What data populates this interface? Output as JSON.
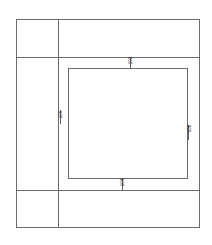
{
  "drawing": {
    "title": "Technical line drawing",
    "background_color": "#ffffff",
    "line_color": "#6b6b6b",
    "label_color": "#2b2b2b",
    "outer_frame": {
      "name": "outer-frame",
      "left": 16,
      "top": 19,
      "right": 199,
      "bottom": 227
    },
    "dividers": {
      "vertical_x": 58,
      "horizontal_upper_y": 57,
      "horizontal_lower_y": 190
    },
    "inner_rect": {
      "name": "inner-rectangle",
      "left": 68,
      "top": 68,
      "right": 187,
      "bottom": 178
    },
    "labels": [
      {
        "id": "top",
        "text": "102",
        "orientation": "vertical",
        "x": 130,
        "y": 62
      },
      {
        "id": "left",
        "text": "100",
        "orientation": "vertical",
        "x": 60,
        "y": 117
      },
      {
        "id": "right",
        "text": "106",
        "orientation": "vertical",
        "x": 188,
        "y": 132
      },
      {
        "id": "bottom",
        "text": "104",
        "orientation": "vertical",
        "x": 122,
        "y": 184
      }
    ]
  }
}
